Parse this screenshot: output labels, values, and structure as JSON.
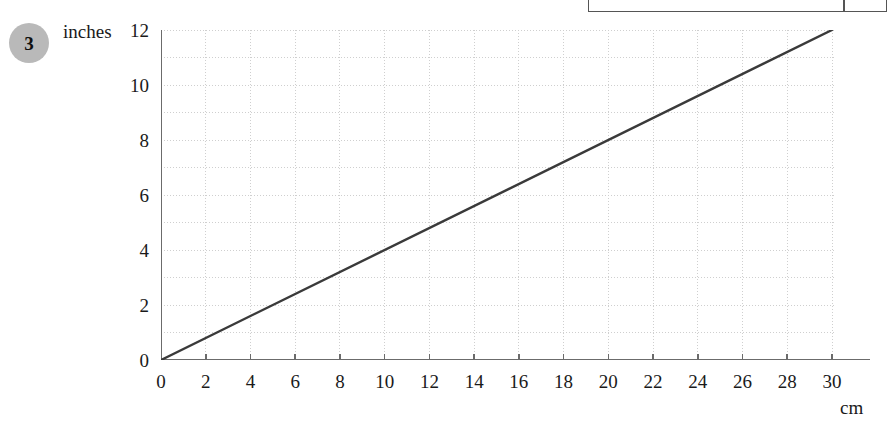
{
  "question": {
    "number": "3"
  },
  "clipped_table": {
    "visible_fragment": true
  },
  "axis_titles": {
    "y": "inches",
    "x": "cm"
  },
  "chart_data": {
    "type": "line",
    "title": "",
    "subtitle": "",
    "xlabel": "cm",
    "ylabel": "inches",
    "xlim": [
      0,
      30
    ],
    "ylim": [
      0,
      12
    ],
    "xticks": [
      0,
      2,
      4,
      6,
      8,
      10,
      12,
      14,
      16,
      18,
      20,
      22,
      24,
      26,
      28,
      30
    ],
    "yticks": [
      0,
      2,
      4,
      6,
      8,
      10,
      12
    ],
    "xtick_labels": [
      "0",
      "2",
      "4",
      "6",
      "8",
      "10",
      "12",
      "14",
      "16",
      "18",
      "20",
      "22",
      "24",
      "26",
      "28",
      "30"
    ],
    "ytick_labels": [
      "0",
      "2",
      "4",
      "6",
      "8",
      "10",
      "12"
    ],
    "grid": true,
    "grid_style": "dotted",
    "grid_color": "#cccccc",
    "grid_x_step": 2,
    "grid_y_step": 1,
    "legend": null,
    "series": [
      {
        "name": "cm to inches conversion",
        "color": "#3a3a3a",
        "x": [
          0,
          30
        ],
        "values": [
          0,
          12
        ]
      }
    ],
    "annotations": []
  },
  "colors": {
    "axis": "#6b6b6b",
    "line": "#3a3a3a",
    "grid": "#cfcfcf",
    "badge": "#b9b9b9",
    "text": "#1a1a1a",
    "table_border": "#555555"
  }
}
